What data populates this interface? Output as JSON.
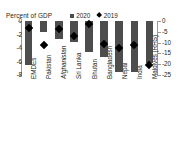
{
  "chart_data": {
    "type": "bar",
    "title": "Percent of GDP",
    "xlabel": "",
    "ylabel": "Percent of GDP",
    "grid": false,
    "legend_position": "top-right",
    "categories": [
      "EMDEs",
      "Pakistan",
      "Afghanistan",
      "Sri Lanka",
      "Bhutan",
      "Bangladesh",
      "Nepal",
      "India",
      "Maldives (RHS)"
    ],
    "series": [
      {
        "name": "2020",
        "type": "bar",
        "values": [
          -6.5,
          -1.6,
          -2.6,
          -3.1,
          -4.6,
          -5.3,
          -7.5,
          -7.5,
          -19.5
        ]
      },
      {
        "name": "2019",
        "type": "marker",
        "values": [
          -1.0,
          -3.5,
          -1.2,
          -2.2,
          -0.4,
          -3.4,
          -4.0,
          -3.5,
          -20.5
        ]
      }
    ],
    "left_axis": {
      "ticks": [
        "0",
        "-2",
        "-4",
        "-6",
        "-8"
      ],
      "values": [
        0,
        -2,
        -4,
        -6,
        -8
      ],
      "ylim": [
        -8,
        0
      ],
      "applies_to": [
        "EMDEs",
        "Pakistan",
        "Afghanistan",
        "Sri Lanka",
        "Bhutan",
        "Bangladesh",
        "Nepal",
        "India"
      ]
    },
    "right_axis": {
      "ticks": [
        "0",
        "-5",
        "-10",
        "-15",
        "-20",
        "-25"
      ],
      "values": [
        0,
        -5,
        -10,
        -15,
        -20,
        -25
      ],
      "ylim": [
        -25,
        0
      ],
      "applies_to": [
        "Maldives (RHS)"
      ]
    },
    "colors": {
      "bar": "#4d4d4d",
      "marker": "#000000",
      "text": "#231f20",
      "background": "#ffffff"
    }
  },
  "legend": {
    "items": [
      {
        "label": "2020",
        "marker": "square"
      },
      {
        "label": "2019",
        "marker": "diamond"
      }
    ]
  }
}
